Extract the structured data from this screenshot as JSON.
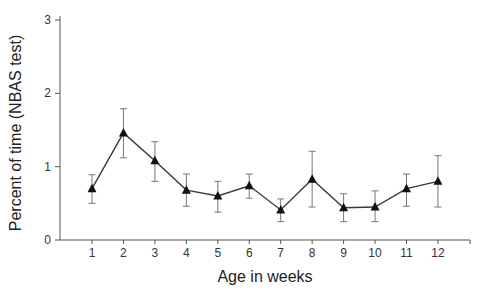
{
  "chart_data": {
    "type": "line",
    "title": "",
    "xlabel": "Age in weeks",
    "ylabel": "Percent of time (NBAS test)",
    "categories": [
      "1",
      "2",
      "3",
      "4",
      "5",
      "6",
      "7",
      "8",
      "9",
      "10",
      "11",
      "12"
    ],
    "x": [
      1,
      2,
      3,
      4,
      5,
      6,
      7,
      8,
      9,
      10,
      11,
      12
    ],
    "series": [
      {
        "name": "Percent of time",
        "marker": "triangle",
        "values": [
          0.7,
          1.46,
          1.08,
          0.68,
          0.6,
          0.74,
          0.41,
          0.83,
          0.44,
          0.45,
          0.7,
          0.8
        ],
        "error_low": [
          0.5,
          1.12,
          0.8,
          0.46,
          0.38,
          0.57,
          0.25,
          0.45,
          0.25,
          0.25,
          0.46,
          0.45
        ],
        "error_high": [
          0.89,
          1.79,
          1.34,
          0.9,
          0.8,
          0.9,
          0.56,
          1.21,
          0.63,
          0.67,
          0.9,
          1.15
        ]
      }
    ],
    "ylim": [
      0,
      3
    ],
    "yticks": [
      0,
      1,
      2,
      3
    ],
    "grid": false,
    "legend": "none"
  },
  "colors": {
    "line": "#3a3a3a",
    "marker": "#111111",
    "errorbar": "#777777",
    "axis": "#555555"
  }
}
